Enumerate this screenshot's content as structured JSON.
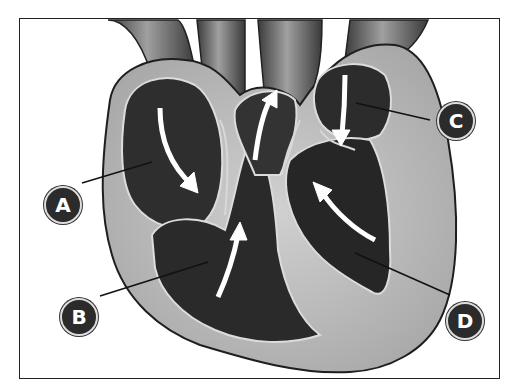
{
  "figure": {
    "labels": [
      {
        "id": "A",
        "text": "A"
      },
      {
        "id": "B",
        "text": "B"
      },
      {
        "id": "C",
        "text": "C"
      },
      {
        "id": "D",
        "text": "D"
      }
    ],
    "colors": {
      "muscle": "#bdbdbd",
      "chamber": "#2a2a2a",
      "vessel": "#6a6a6a",
      "arrow": "#ffffff",
      "outline": "#1e1e1e"
    }
  }
}
